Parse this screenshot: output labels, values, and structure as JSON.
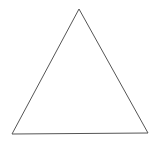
{
  "diagram": {
    "shape": "triangle",
    "kind": "equilateral-triangle-outline",
    "background_color": "#ffffff",
    "stroke_color": "#555555",
    "fill_color": "none",
    "stroke_width": 1,
    "vertices": {
      "apex": [
        79,
        9
      ],
      "bottom_left": [
        12,
        134
      ],
      "bottom_right": [
        148,
        133
      ]
    }
  }
}
